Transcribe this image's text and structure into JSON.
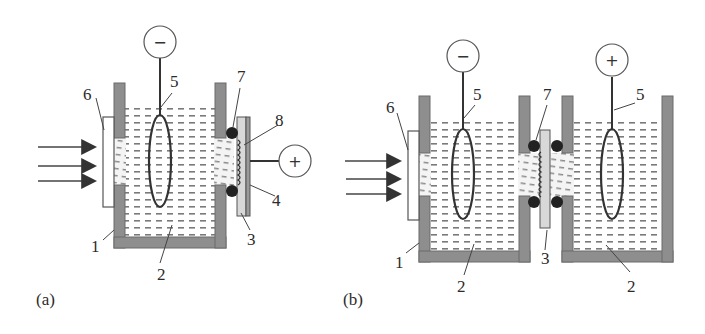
{
  "figure": {
    "type": "schematic diagram of photoelectrochemical cells",
    "panels": [
      {
        "id": "a",
        "label": "(a)",
        "terminals": {
          "negative": "−",
          "positive": "+"
        },
        "callouts": {
          "n1": "1",
          "n2": "2",
          "n3": "3",
          "n4": "4",
          "n5": "5",
          "n6": "6",
          "n7": "7",
          "n8": "8"
        }
      },
      {
        "id": "b",
        "label": "(b)",
        "terminals": {
          "negative": "−",
          "positive": "+"
        },
        "callouts": {
          "n1": "1",
          "n2_left": "2",
          "n2_right": "2",
          "n3": "3",
          "n5_left": "5",
          "n5_right": "5",
          "n6": "6",
          "n7": "7"
        }
      }
    ],
    "legend_numbers": {
      "1": "cell body (wall)",
      "2": "electrolyte",
      "3": "membrane / sample",
      "4": "back contact",
      "5": "electrode loop",
      "6": "optical window",
      "7": "O-ring seal",
      "8": "contact spring"
    },
    "colors": {
      "wall": "#8e8e8e",
      "liquid_dash": "#7a7a7a",
      "oring": "#222222",
      "outline": "#555555"
    }
  }
}
